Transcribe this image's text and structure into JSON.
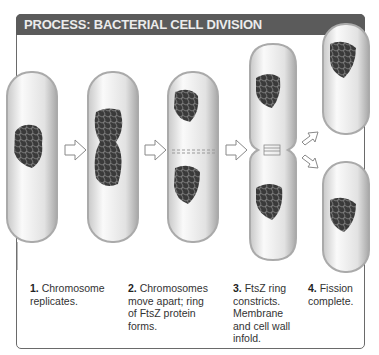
{
  "title": "PROCESS: BACTERIAL CELL DIVISION",
  "steps": [
    {
      "num": "1.",
      "text": "Chromosome replicates."
    },
    {
      "num": "2.",
      "text": "Chromosomes move apart; ring of FtsZ protein forms."
    },
    {
      "num": "3.",
      "text": "FtsZ ring constricts. Membrane and cell wall infold."
    },
    {
      "num": "4.",
      "text": "Fission complete."
    }
  ],
  "colors": {
    "header": "#5b5b5b",
    "cell": "#e8e8e8",
    "chromosome": "#3a3a3a"
  }
}
